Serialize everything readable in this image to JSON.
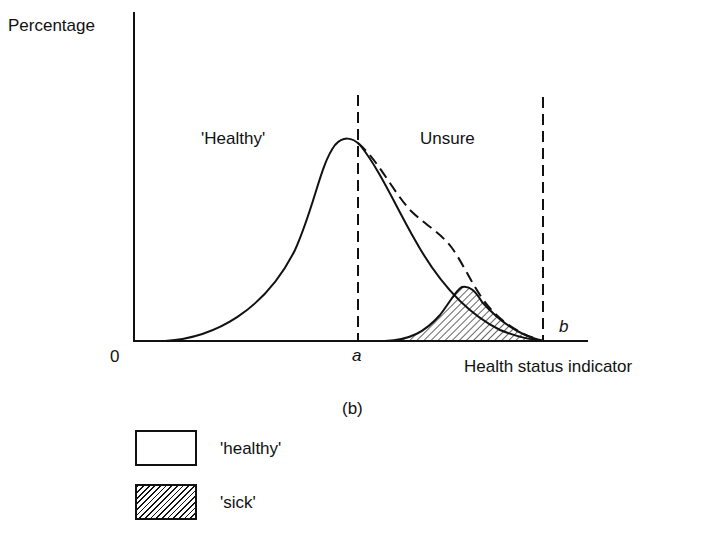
{
  "figure": {
    "y_axis_label": "Percentage",
    "x_axis_label": "Health status indicator",
    "origin_label": "0",
    "threshold_a_label": "a",
    "threshold_b_label": "b",
    "region_healthy_label": "'Healthy'",
    "region_unsure_label": "Unsure",
    "panel_label": "(b)"
  },
  "legend": {
    "items": [
      {
        "label": "'healthy'",
        "pattern": "blank"
      },
      {
        "label": "'sick'",
        "pattern": "hatched"
      }
    ]
  },
  "colors": {
    "ink": "#111111",
    "background": "#ffffff"
  }
}
